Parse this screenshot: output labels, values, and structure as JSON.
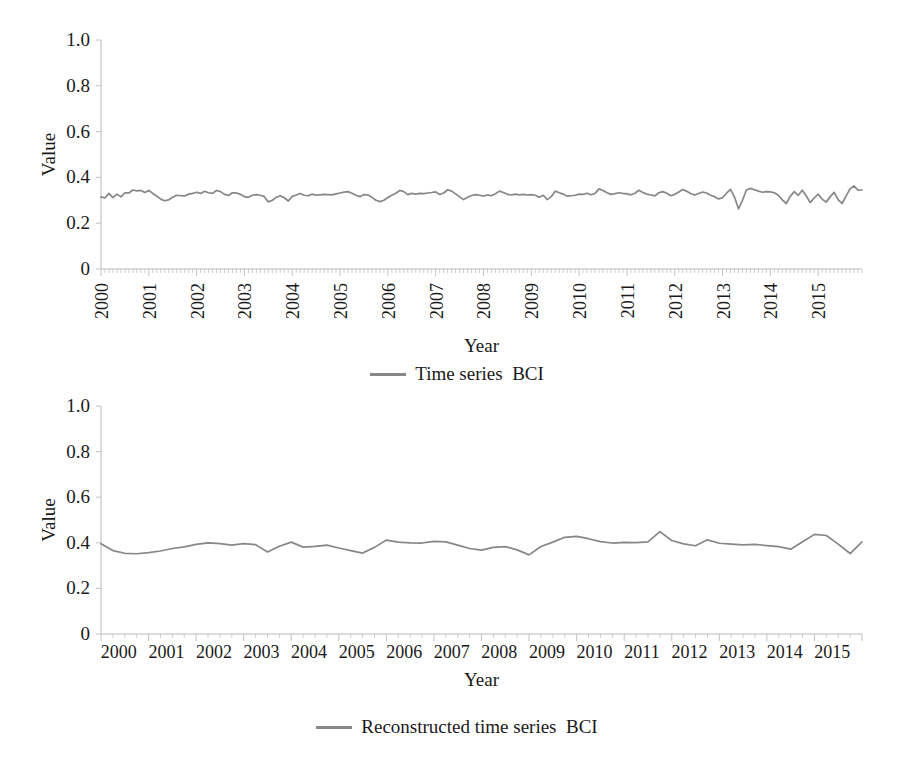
{
  "figure": {
    "background": "#ffffff",
    "line_color": "#878787",
    "axis_color": "#b9b9b9",
    "text_color": "#1a1a1a"
  },
  "panels": [
    {
      "id": "top",
      "axis_title_x": "Year",
      "axis_title_y": "Value",
      "legend_label": "Time series  BCI",
      "y_ticks": [
        "1.0",
        "0.8",
        "0.6",
        "0.4",
        "0.2",
        "0"
      ],
      "x_ticks": [
        "2000",
        "2001",
        "2002",
        "2003",
        "2004",
        "2005",
        "2006",
        "2007",
        "2008",
        "2009",
        "2010",
        "2011",
        "2012",
        "2013",
        "2014",
        "2015"
      ],
      "x_tick_rotated": true
    },
    {
      "id": "bottom",
      "axis_title_x": "Year",
      "axis_title_y": "Value",
      "legend_label": "Reconstructed time series  BCI",
      "y_ticks": [
        "1.0",
        "0.8",
        "0.6",
        "0.4",
        "0.2",
        "0"
      ],
      "x_ticks": [
        "2000",
        "2001",
        "2002",
        "2003",
        "2004",
        "2005",
        "2006",
        "2007",
        "2008",
        "2009",
        "2010",
        "2011",
        "2012",
        "2013",
        "2014",
        "2015"
      ],
      "x_tick_rotated": false
    }
  ],
  "chart_data": [
    {
      "type": "line",
      "title": "",
      "xlabel": "Year",
      "ylabel": "Value",
      "ylim": [
        0,
        1.0
      ],
      "yticks": [
        0,
        0.2,
        0.4,
        0.6,
        0.8,
        1.0
      ],
      "grid": false,
      "legend_position": "bottom-center",
      "x_start_year": 2000,
      "x_end_year": 2015.92,
      "x_frequency": "monthly",
      "categories": [
        "2000",
        "2001",
        "2002",
        "2003",
        "2004",
        "2005",
        "2006",
        "2007",
        "2008",
        "2009",
        "2010",
        "2011",
        "2012",
        "2013",
        "2014",
        "2015"
      ],
      "series": [
        {
          "name": "Time series  BCI",
          "color": "#878787",
          "values": [
            0.315,
            0.31,
            0.33,
            0.312,
            0.327,
            0.315,
            0.333,
            0.332,
            0.345,
            0.341,
            0.343,
            0.334,
            0.343,
            0.33,
            0.318,
            0.305,
            0.298,
            0.302,
            0.313,
            0.322,
            0.32,
            0.319,
            0.327,
            0.33,
            0.335,
            0.33,
            0.339,
            0.333,
            0.33,
            0.343,
            0.338,
            0.326,
            0.321,
            0.333,
            0.332,
            0.326,
            0.316,
            0.313,
            0.322,
            0.325,
            0.322,
            0.316,
            0.293,
            0.3,
            0.313,
            0.32,
            0.311,
            0.297,
            0.317,
            0.323,
            0.33,
            0.322,
            0.32,
            0.327,
            0.322,
            0.324,
            0.326,
            0.325,
            0.324,
            0.328,
            0.332,
            0.336,
            0.338,
            0.331,
            0.322,
            0.316,
            0.325,
            0.323,
            0.313,
            0.3,
            0.294,
            0.3,
            0.312,
            0.322,
            0.331,
            0.343,
            0.338,
            0.325,
            0.33,
            0.327,
            0.33,
            0.329,
            0.332,
            0.334,
            0.337,
            0.325,
            0.332,
            0.346,
            0.34,
            0.328,
            0.315,
            0.303,
            0.313,
            0.321,
            0.325,
            0.322,
            0.318,
            0.324,
            0.32,
            0.329,
            0.34,
            0.334,
            0.326,
            0.323,
            0.327,
            0.324,
            0.326,
            0.323,
            0.325,
            0.322,
            0.313,
            0.322,
            0.303,
            0.316,
            0.34,
            0.333,
            0.327,
            0.318,
            0.32,
            0.322,
            0.327,
            0.326,
            0.331,
            0.324,
            0.33,
            0.35,
            0.343,
            0.333,
            0.326,
            0.329,
            0.333,
            0.33,
            0.328,
            0.324,
            0.331,
            0.344,
            0.334,
            0.327,
            0.323,
            0.319,
            0.333,
            0.338,
            0.331,
            0.32,
            0.326,
            0.336,
            0.347,
            0.34,
            0.33,
            0.323,
            0.33,
            0.336,
            0.332,
            0.322,
            0.316,
            0.306,
            0.311,
            0.331,
            0.348,
            0.314,
            0.263,
            0.3,
            0.345,
            0.352,
            0.346,
            0.34,
            0.335,
            0.338,
            0.337,
            0.333,
            0.322,
            0.302,
            0.286,
            0.317,
            0.338,
            0.322,
            0.344,
            0.32,
            0.29,
            0.31,
            0.327,
            0.305,
            0.292,
            0.315,
            0.335,
            0.303,
            0.286,
            0.318,
            0.35,
            0.363,
            0.344,
            0.345
          ]
        }
      ]
    },
    {
      "type": "line",
      "title": "",
      "xlabel": "Year",
      "ylabel": "Value",
      "ylim": [
        0,
        1.0
      ],
      "yticks": [
        0,
        0.2,
        0.4,
        0.6,
        0.8,
        1.0
      ],
      "grid": false,
      "legend_position": "bottom-center",
      "x_start_year": 2000,
      "x_end_year": 2015.75,
      "x_frequency": "quarterly",
      "categories": [
        "2000",
        "2001",
        "2002",
        "2003",
        "2004",
        "2005",
        "2006",
        "2007",
        "2008",
        "2009",
        "2010",
        "2011",
        "2012",
        "2013",
        "2014",
        "2015"
      ],
      "series": [
        {
          "name": "Reconstructed time series  BCI",
          "color": "#878787",
          "values": [
            0.396,
            0.366,
            0.354,
            0.352,
            0.357,
            0.364,
            0.375,
            0.382,
            0.393,
            0.4,
            0.396,
            0.39,
            0.396,
            0.392,
            0.36,
            0.385,
            0.403,
            0.381,
            0.384,
            0.39,
            0.377,
            0.366,
            0.355,
            0.38,
            0.412,
            0.403,
            0.4,
            0.399,
            0.406,
            0.404,
            0.39,
            0.375,
            0.368,
            0.38,
            0.383,
            0.369,
            0.347,
            0.384,
            0.403,
            0.424,
            0.428,
            0.418,
            0.405,
            0.399,
            0.402,
            0.401,
            0.404,
            0.449,
            0.41,
            0.395,
            0.387,
            0.413,
            0.398,
            0.394,
            0.391,
            0.393,
            0.388,
            0.383,
            0.372,
            0.405,
            0.437,
            0.432,
            0.394,
            0.353,
            0.404
          ]
        }
      ]
    }
  ]
}
